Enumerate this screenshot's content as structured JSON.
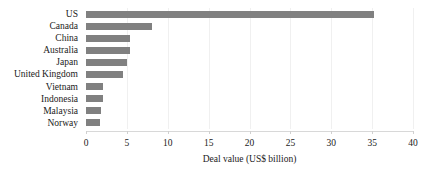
{
  "chart_data": {
    "type": "bar",
    "orientation": "horizontal",
    "title": "",
    "subtitle": "",
    "xlabel": "Deal value (US$ billion)",
    "ylabel": "",
    "xlim": [
      0,
      40
    ],
    "xticks": [
      0,
      5,
      10,
      15,
      20,
      25,
      30,
      35,
      40
    ],
    "xtick_labels": [
      "0",
      "5",
      "10",
      "15",
      "20",
      "25",
      "30",
      "35",
      "40"
    ],
    "grid": true,
    "grid_axis": "x",
    "legend": false,
    "legend_position": "none",
    "bar_color": "#808080",
    "categories": [
      "US",
      "Canada",
      "China",
      "Australia",
      "Japan",
      "United Kingdom",
      "Vietnam",
      "Indonesia",
      "Malaysia",
      "Norway"
    ],
    "values": [
      35.2,
      8.1,
      5.4,
      5.35,
      5.0,
      4.5,
      2.1,
      2.05,
      1.8,
      1.75
    ]
  }
}
